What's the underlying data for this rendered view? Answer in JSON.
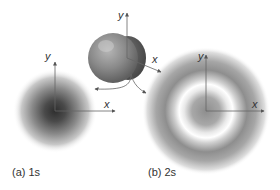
{
  "figure": {
    "panel_a": {
      "caption": "(a) 1s",
      "axes": {
        "x_label": "x",
        "y_label": "y"
      },
      "center": [
        55,
        111
      ],
      "radius": 41,
      "shading": "radial gradient, dark at center fading to white"
    },
    "panel_b": {
      "caption": "(b) 2s",
      "axes": {
        "x_label": "x",
        "y_label": "y"
      },
      "center": [
        206,
        111
      ],
      "outer_radius": 62,
      "node_ring_radius": 26,
      "shading": "grey core, white spherical node ring, grey outer shell"
    },
    "cutaway": {
      "description": "3D sphere cutaway showing internal structure",
      "axes": {
        "x_label": "x",
        "y_label": "y"
      },
      "center": [
        115,
        56
      ],
      "radius": 25
    },
    "colors": {
      "background": "#ffffff",
      "density_dark": "#3a3a3a",
      "axis": "#555555",
      "sphere_front": "#8c8c8c",
      "sphere_back": "#5e5e5e"
    }
  }
}
